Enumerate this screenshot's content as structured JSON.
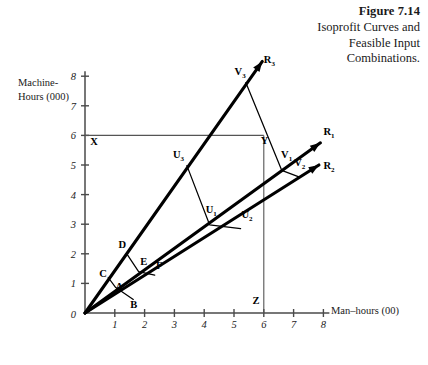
{
  "caption": {
    "figure_number": "Figure 7.14",
    "title_line1": "Isoprofit Curves and",
    "title_line2": "Feasible Input",
    "title_line3": "Combinations."
  },
  "chart_data": {
    "type": "line",
    "title": "Isoprofit Curves and Feasible Input Combinations.",
    "xlabel": "Man–hours (00)",
    "ylabel_line1": "Machine-",
    "ylabel_line2": "Hours (000)",
    "xlim": [
      0,
      8
    ],
    "ylim": [
      0,
      8
    ],
    "xticks": [
      "1",
      "2",
      "3",
      "4",
      "5",
      "6",
      "7",
      "8"
    ],
    "yticks": [
      "1",
      "2",
      "3",
      "4",
      "5",
      "6",
      "7",
      "8"
    ],
    "origin_label": "0",
    "grid": false,
    "legend": "none",
    "rays": [
      {
        "name": "R₃",
        "label": "R",
        "sub": "3",
        "from": [
          0,
          0
        ],
        "to": [
          5.95,
          8.5
        ],
        "arrow": true,
        "label_at": [
          6.0,
          8.45
        ]
      },
      {
        "name": "R₁",
        "label": "R",
        "sub": "1",
        "from": [
          0,
          0
        ],
        "to": [
          7.9,
          5.75
        ],
        "arrow": true,
        "label_at": [
          8.0,
          6.0
        ]
      },
      {
        "name": "R₂",
        "label": "R",
        "sub": "2",
        "from": [
          0,
          0
        ],
        "to": [
          7.85,
          5.0
        ],
        "arrow": true,
        "label_at": [
          8.0,
          4.85
        ]
      }
    ],
    "isoprofit_curves": [
      {
        "name": "CAB",
        "points": [
          {
            "label": "C",
            "sub": "",
            "x": 0.78,
            "y": 1.2,
            "label_at": [
              0.48,
              1.22
            ]
          },
          {
            "label": "A",
            "sub": "",
            "x": 1.02,
            "y": 0.87,
            "label_at": [
              1.02,
              0.78
            ]
          },
          {
            "label": "B",
            "sub": "",
            "x": 1.62,
            "y": 0.46,
            "label_at": [
              1.52,
              0.18
            ]
          }
        ]
      },
      {
        "name": "DEF",
        "points": [
          {
            "label": "D",
            "sub": "",
            "x": 1.42,
            "y": 1.97,
            "label_at": [
              1.12,
              2.2
            ]
          },
          {
            "label": "E",
            "sub": "",
            "x": 1.8,
            "y": 1.4,
            "label_at": [
              1.85,
              1.62
            ]
          },
          {
            "label": "F",
            "sub": "",
            "x": 2.34,
            "y": 1.28,
            "label_at": [
              2.38,
              1.5
            ]
          }
        ]
      },
      {
        "name": "U3-U1-U2",
        "points": [
          {
            "label": "U",
            "sub": "3",
            "x": 3.42,
            "y": 4.98,
            "label_at": [
              2.95,
              5.22
            ]
          },
          {
            "label": "U",
            "sub": "1",
            "x": 4.18,
            "y": 2.98,
            "label_at": [
              4.05,
              3.38
            ]
          },
          {
            "label": "U",
            "sub": "2",
            "x": 5.22,
            "y": 2.85,
            "label_at": [
              5.25,
              3.22
            ]
          }
        ]
      },
      {
        "name": "V3-V1-V2",
        "points": [
          {
            "label": "V",
            "sub": "3",
            "x": 5.4,
            "y": 7.78,
            "label_at": [
              5.02,
              8.05
            ]
          },
          {
            "label": "V",
            "sub": "1",
            "x": 6.6,
            "y": 4.82,
            "label_at": [
              6.58,
              5.22
            ]
          },
          {
            "label": "V",
            "sub": "2",
            "x": 7.22,
            "y": 4.58,
            "label_at": [
              7.02,
              4.95
            ]
          }
        ]
      }
    ],
    "constraint_lines": [
      {
        "name": "machine-hours-constraint",
        "from": [
          0,
          6
        ],
        "to": [
          6.0,
          6.0
        ],
        "endpoint_label": "Y",
        "endpoint_label_at": [
          6.0,
          5.72
        ],
        "origin_label": "X",
        "origin_label_at": [
          0.18,
          5.68
        ]
      },
      {
        "name": "man-hours-constraint",
        "from": [
          6.0,
          6.0
        ],
        "to": [
          6.0,
          0
        ],
        "endpoint_label": "Z",
        "endpoint_label_at": [
          5.72,
          0.3
        ]
      }
    ]
  }
}
